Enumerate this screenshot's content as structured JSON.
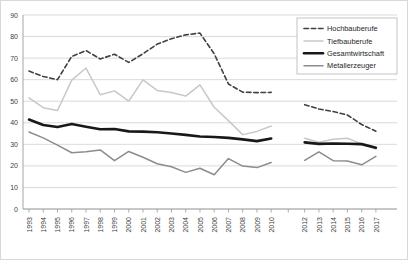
{
  "chart_data": {
    "type": "line",
    "title": "",
    "xlabel": "",
    "ylabel": "",
    "ylim": [
      0,
      90
    ],
    "ytick_step": 10,
    "yticks": [
      0,
      10,
      20,
      30,
      40,
      50,
      60,
      70,
      80,
      90
    ],
    "grid": true,
    "legend_position": "top-right",
    "x": [
      1993,
      1994,
      1995,
      1996,
      1997,
      1998,
      1999,
      2000,
      2001,
      2002,
      2003,
      2004,
      2005,
      2006,
      2007,
      2008,
      2009,
      2010,
      2012,
      2013,
      2014,
      2015,
      2016,
      2017
    ],
    "xtick_labels": [
      "1993",
      "1994",
      "1995",
      "1996",
      "1997",
      "1998",
      "1999",
      "2000",
      "2001",
      "2002",
      "2003",
      "2004",
      "2005",
      "2006",
      "2007",
      "2008",
      "2009",
      "2010",
      "2012",
      "2013",
      "2014",
      "2015",
      "2016",
      "2017"
    ],
    "gap_after_x": 2010,
    "series": [
      {
        "name": "Hochbauberufe",
        "style": "dashed",
        "color": "#404040",
        "width": 1.6,
        "values": [
          64.0,
          61.5,
          60.0,
          70.8,
          73.5,
          69.6,
          71.8,
          68.0,
          72.0,
          76.5,
          79.0,
          80.8,
          81.6,
          72.0,
          58.0,
          54.2,
          54.0,
          54.1,
          48.4,
          46.4,
          45.2,
          43.6,
          39.2,
          36.1
        ]
      },
      {
        "name": "Tiefbauberufe",
        "style": "solid",
        "color": "#c8c8c8",
        "width": 1.5,
        "values": [
          51.6,
          47.0,
          45.7,
          59.8,
          65.4,
          53.0,
          54.8,
          50.0,
          59.9,
          55.0,
          54.0,
          52.4,
          57.6,
          47.2,
          41.0,
          34.5,
          36.0,
          38.5,
          32.8,
          31.0,
          32.4,
          32.8,
          30.2,
          27.8
        ]
      },
      {
        "name": "Gesamtwirtschaft",
        "style": "solid",
        "color": "#181818",
        "width": 2.6,
        "values": [
          41.5,
          39.0,
          38.0,
          39.4,
          38.2,
          37.0,
          37.1,
          36.0,
          35.9,
          35.6,
          35.0,
          34.4,
          33.6,
          33.4,
          33.0,
          32.3,
          31.5,
          32.7,
          30.9,
          30.2,
          30.4,
          30.3,
          30.1,
          28.4
        ]
      },
      {
        "name": "Metallerzeuger",
        "style": "solid",
        "color": "#8c8c8c",
        "width": 1.5,
        "values": [
          35.7,
          33.0,
          29.6,
          26.1,
          26.6,
          27.4,
          22.4,
          26.7,
          24.0,
          21.0,
          19.6,
          17.0,
          18.9,
          15.9,
          23.4,
          19.9,
          19.2,
          21.6,
          22.6,
          26.5,
          22.4,
          22.3,
          20.5,
          24.4
        ]
      }
    ]
  },
  "legend": {
    "items": [
      {
        "label": "Hochbauberufe"
      },
      {
        "label": "Tiefbauberufe"
      },
      {
        "label": "Gesamtwirtschaft"
      },
      {
        "label": "Metallerzeuger"
      }
    ]
  }
}
